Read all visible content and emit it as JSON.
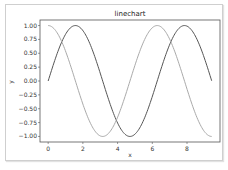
{
  "chart_data": {
    "type": "line",
    "title": "linechart",
    "xlabel": "x",
    "ylabel": "y",
    "xlim": [
      -0.47,
      9.9
    ],
    "ylim": [
      -1.1,
      1.1
    ],
    "x_ticks": [
      0,
      2,
      4,
      6,
      8
    ],
    "x_tick_labels": [
      "0",
      "2",
      "4",
      "6",
      "8"
    ],
    "y_ticks": [
      1.0,
      0.75,
      0.5,
      0.25,
      0.0,
      -0.25,
      -0.5,
      -0.75,
      -1.0
    ],
    "y_tick_labels": [
      "1.00",
      "0.75",
      "0.50",
      "0.25",
      "0.00",
      "−0.25",
      "−0.50",
      "−0.75",
      "−1.00"
    ],
    "grid": false,
    "legend": null,
    "x_range": [
      0,
      9.42
    ],
    "series": [
      {
        "name": "sin(x)",
        "color": "#555555",
        "function": "sin",
        "x": [
          0,
          0.785,
          1.571,
          2.356,
          3.142,
          3.927,
          4.712,
          5.498,
          6.283,
          7.069,
          7.854,
          8.639,
          9.42
        ],
        "values": [
          0.0,
          0.71,
          1.0,
          0.71,
          0.0,
          -0.71,
          -1.0,
          -0.71,
          0.0,
          0.71,
          1.0,
          0.71,
          0.0
        ]
      },
      {
        "name": "cos(x)",
        "color": "#aaaaaa",
        "function": "cos",
        "x": [
          0,
          0.785,
          1.571,
          2.356,
          3.142,
          3.927,
          4.712,
          5.498,
          6.283,
          7.069,
          7.854,
          8.639,
          9.42
        ],
        "values": [
          1.0,
          0.71,
          0.0,
          -0.71,
          -1.0,
          -0.71,
          0.0,
          0.71,
          1.0,
          0.71,
          0.0,
          -0.71,
          -1.0
        ]
      }
    ]
  }
}
